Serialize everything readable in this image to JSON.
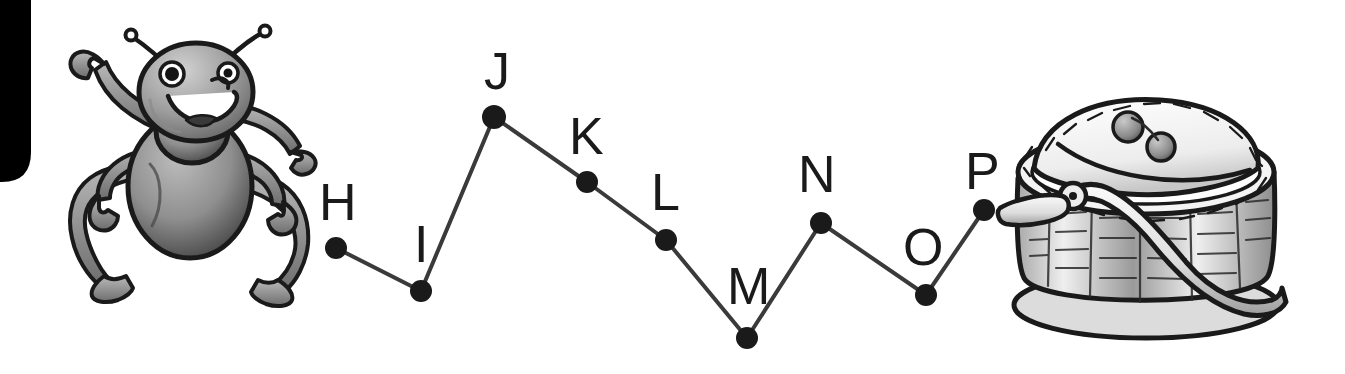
{
  "worksheet": {
    "type": "connect-the-dots",
    "title": "Ant and Picnic Basket Dot-to-Dot",
    "background_color": "#ffffff",
    "ink_color": "#1a1a1a",
    "dot_color": "#1a1a1a",
    "line_color": "#3a3a3a"
  },
  "corner_mark": {
    "name": "black-corner-block",
    "color": "#000000",
    "x": 0,
    "y": 0,
    "width": 31,
    "height": 182,
    "corner_radius": 26
  },
  "illustrations": [
    {
      "name": "ant-illustration",
      "label": "cartoon ant waving",
      "x": 62,
      "y": 22,
      "width": 250,
      "height": 258,
      "fill": "#8d8d8d",
      "outline": "#1a1a1a"
    },
    {
      "name": "picnic-basket-illustration",
      "label": "woven picnic basket with lid and berries",
      "x": 985,
      "y": 72,
      "width": 315,
      "height": 265,
      "fill": "#e4e4e4",
      "outline": "#1a1a1a"
    }
  ],
  "dots": [
    {
      "letter": "H",
      "cx": 336,
      "cy": 248,
      "r": 11,
      "label_x": 319,
      "label_y": 176,
      "label_size": 52
    },
    {
      "letter": "I",
      "cx": 421,
      "cy": 291,
      "r": 11,
      "label_x": 414,
      "label_y": 218,
      "label_size": 52
    },
    {
      "letter": "J",
      "cx": 494,
      "cy": 117,
      "r": 12,
      "label_x": 484,
      "label_y": 45,
      "label_size": 52
    },
    {
      "letter": "K",
      "cx": 587,
      "cy": 182,
      "r": 11,
      "label_x": 569,
      "label_y": 110,
      "label_size": 52
    },
    {
      "letter": "L",
      "cx": 666,
      "cy": 240,
      "r": 11,
      "label_x": 651,
      "label_y": 166,
      "label_size": 52
    },
    {
      "letter": "M",
      "cx": 747,
      "cy": 338,
      "r": 11,
      "label_x": 727,
      "label_y": 260,
      "label_size": 52
    },
    {
      "letter": "N",
      "cx": 821,
      "cy": 223,
      "r": 11,
      "label_x": 798,
      "label_y": 148,
      "label_size": 52
    },
    {
      "letter": "O",
      "cx": 926,
      "cy": 295,
      "r": 11,
      "label_x": 903,
      "label_y": 221,
      "label_size": 52
    },
    {
      "letter": "P",
      "cx": 984,
      "cy": 210,
      "r": 11,
      "label_x": 965,
      "label_y": 145,
      "label_size": 52
    }
  ],
  "path_sequence": [
    "H",
    "I",
    "J",
    "K",
    "L",
    "M",
    "N",
    "O",
    "P"
  ],
  "line_width": 4,
  "berries": [
    {
      "name": "berry-one",
      "cx": 1128,
      "cy": 127,
      "r": 15
    },
    {
      "name": "berry-two",
      "cx": 1161,
      "cy": 147,
      "r": 14
    }
  ]
}
